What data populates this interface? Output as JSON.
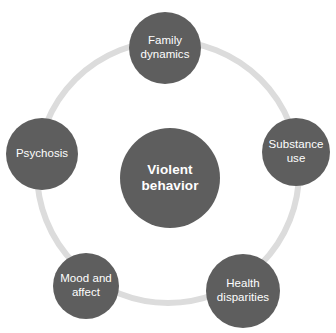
{
  "diagram": {
    "type": "cycle",
    "canvas": {
      "width": 336,
      "height": 333,
      "background": "#ffffff"
    },
    "ring": {
      "name": "connector-ring",
      "color": "#dcdcdc",
      "center_x": 168,
      "center_y": 172,
      "radius": 131,
      "stroke_width": 6
    },
    "center": {
      "label": "Violent behavior",
      "line1": "Violent",
      "line2": "behavior",
      "color": "#5e5e5e",
      "text_color": "#ffffff",
      "diameter": 100,
      "cx": 170,
      "cy": 178
    },
    "satellites": [
      {
        "id": "family-dynamics",
        "label": "Family dynamics",
        "line1": "Family",
        "line2": "dynamics",
        "color": "#5e5e5e",
        "text_color": "#ffffff",
        "diameter": 72,
        "cx": 165,
        "cy": 48,
        "position": "top"
      },
      {
        "id": "substance-use",
        "label": "Substance use",
        "line1": "Substance",
        "line2": "use",
        "color": "#5e5e5e",
        "text_color": "#ffffff",
        "diameter": 68,
        "cx": 296,
        "cy": 152,
        "position": "right"
      },
      {
        "id": "health-disparities",
        "label": "Health disparities",
        "line1": "Health",
        "line2": "disparities",
        "color": "#5e5e5e",
        "text_color": "#ffffff",
        "diameter": 74,
        "cx": 243,
        "cy": 291,
        "position": "bottom-right"
      },
      {
        "id": "mood-and-affect",
        "label": "Mood and affect",
        "line1": "Mood and",
        "line2": "affect",
        "color": "#5e5e5e",
        "text_color": "#ffffff",
        "diameter": 66,
        "cx": 86,
        "cy": 286,
        "position": "bottom-left"
      },
      {
        "id": "psychosis",
        "label": "Psychosis",
        "line1": "Psychosis",
        "line2": "",
        "color": "#5e5e5e",
        "text_color": "#ffffff",
        "diameter": 72,
        "cx": 42,
        "cy": 154,
        "position": "left"
      }
    ]
  }
}
